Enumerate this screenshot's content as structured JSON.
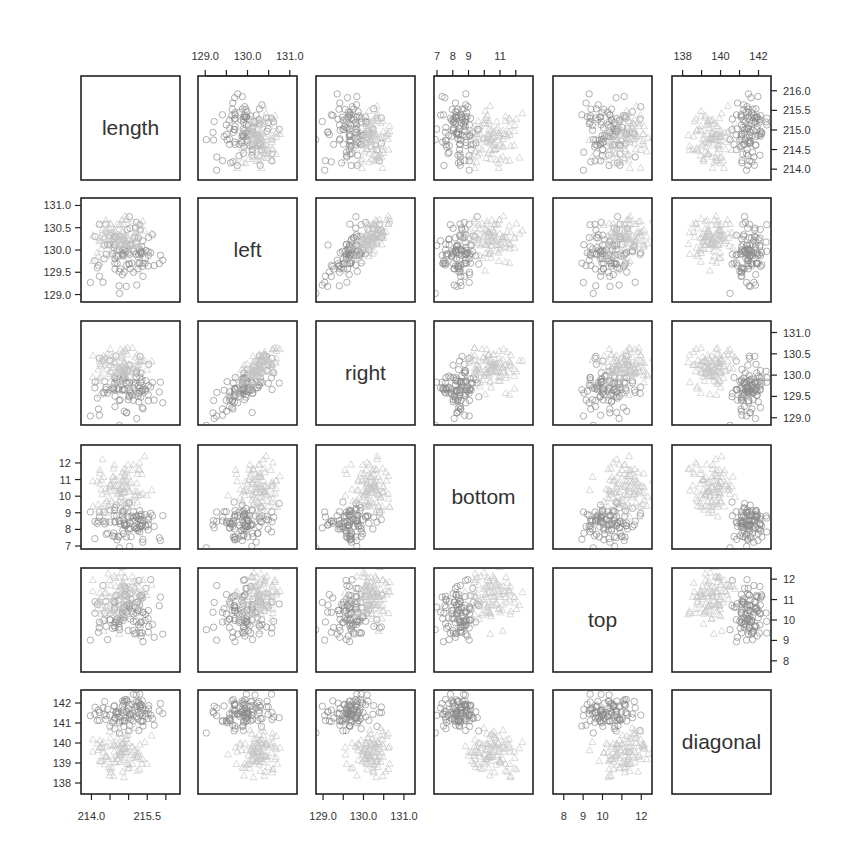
{
  "chart_data": {
    "type": "scatter",
    "subtype": "scatterplot-matrix",
    "title": "",
    "variables": [
      "length",
      "left",
      "right",
      "bottom",
      "top",
      "diagonal"
    ],
    "ranges": {
      "length": [
        213.8,
        216.3
      ],
      "left": [
        128.9,
        131.1
      ],
      "right": [
        128.9,
        131.2
      ],
      "bottom": [
        7.0,
        12.9
      ],
      "top": [
        7.6,
        12.4
      ],
      "diagonal": [
        137.6,
        142.5
      ]
    },
    "axes": {
      "top": [
        {
          "col": 1,
          "var": "left",
          "ticks": [
            129.0,
            129.5,
            130.0,
            130.5,
            131.0
          ],
          "labels": [
            "129.0",
            "130.0",
            "131.0"
          ],
          "label_values": [
            129.0,
            130.0,
            131.0
          ]
        },
        {
          "col": 3,
          "var": "bottom",
          "ticks": [
            7,
            8,
            9,
            10,
            11,
            12
          ],
          "labels": [
            "7",
            "8",
            "9",
            "11"
          ],
          "label_values": [
            7,
            8,
            9,
            11
          ]
        },
        {
          "col": 5,
          "var": "diagonal",
          "ticks": [
            138,
            139,
            140,
            141,
            142
          ],
          "labels": [
            "138",
            "140",
            "142"
          ],
          "label_values": [
            138,
            140,
            142
          ]
        }
      ],
      "bottom": [
        {
          "col": 0,
          "var": "length",
          "ticks": [
            214.0,
            214.5,
            215.0,
            215.5,
            216.0
          ],
          "labels": [
            "214.0",
            "215.5"
          ],
          "label_values": [
            214.0,
            215.5
          ]
        },
        {
          "col": 2,
          "var": "right",
          "ticks": [
            129.0,
            129.5,
            130.0,
            130.5,
            131.0
          ],
          "labels": [
            "129.0",
            "130.0",
            "131.0"
          ],
          "label_values": [
            129.0,
            130.0,
            131.0
          ]
        },
        {
          "col": 4,
          "var": "top",
          "ticks": [
            8,
            9,
            10,
            11,
            12
          ],
          "labels": [
            "8",
            "9",
            "10",
            "12"
          ],
          "label_values": [
            8,
            9,
            10,
            12
          ]
        }
      ],
      "left": [
        {
          "row": 1,
          "var": "left",
          "ticks": [
            129.0,
            129.5,
            130.0,
            130.5,
            131.0
          ],
          "labels": [
            "129.0",
            "129.5",
            "130.0",
            "130.5",
            "131.0"
          ]
        },
        {
          "row": 3,
          "var": "bottom",
          "ticks": [
            7,
            8,
            9,
            10,
            11,
            12
          ],
          "labels": [
            "7",
            "8",
            "9",
            "10",
            "11",
            "12"
          ]
        },
        {
          "row": 5,
          "var": "diagonal",
          "ticks": [
            138,
            139,
            140,
            141,
            142
          ],
          "labels": [
            "138",
            "139",
            "140",
            "141",
            "142"
          ]
        }
      ],
      "right": [
        {
          "row": 0,
          "var": "length",
          "ticks": [
            214.0,
            214.5,
            215.0,
            215.5,
            216.0
          ],
          "labels": [
            "214.0",
            "214.5",
            "215.0",
            "215.5",
            "216.0"
          ]
        },
        {
          "row": 2,
          "var": "right",
          "ticks": [
            129.0,
            129.5,
            130.0,
            130.5,
            131.0
          ],
          "labels": [
            "129.0",
            "129.5",
            "130.0",
            "130.5",
            "131.0"
          ]
        },
        {
          "row": 4,
          "var": "top",
          "ticks": [
            8,
            9,
            10,
            11,
            12
          ],
          "labels": [
            "8",
            "9",
            "10",
            "11",
            "12"
          ]
        }
      ]
    },
    "series": [
      {
        "name": "genuine",
        "marker": "circle",
        "color": "#8a8a8a",
        "n": 100,
        "means": {
          "length": 214.97,
          "left": 129.94,
          "right": 129.72,
          "bottom": 8.31,
          "top": 10.17,
          "diagonal": 141.52
        },
        "sds": {
          "length": 0.38,
          "left": 0.36,
          "right": 0.35,
          "bottom": 0.64,
          "top": 0.65,
          "diagonal": 0.45
        }
      },
      {
        "name": "counterfeit",
        "marker": "triangle",
        "color": "#c4c4c4",
        "n": 100,
        "means": {
          "length": 214.82,
          "left": 130.3,
          "right": 130.19,
          "bottom": 10.53,
          "top": 11.13,
          "diagonal": 139.45
        },
        "sds": {
          "length": 0.35,
          "left": 0.26,
          "right": 0.29,
          "bottom": 0.8,
          "top": 0.63,
          "diagonal": 0.56
        }
      }
    ],
    "correlation_hint": {
      "left-right": 0.75
    },
    "grid": false,
    "legend": null
  },
  "layout": {
    "col_x": [
      81,
      198,
      316,
      434,
      553,
      672
    ],
    "row_y": [
      76,
      198,
      321,
      445,
      568,
      690
    ],
    "panel_w": 99,
    "panel_h": 104
  }
}
